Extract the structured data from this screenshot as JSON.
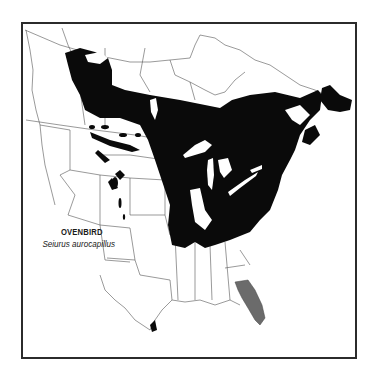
{
  "map": {
    "title_common": "OVENBIRD",
    "title_scientific": "Seiurus aurocapillus",
    "legend": [
      {
        "name": "breeding-range",
        "color": "#0a0a0a"
      },
      {
        "name": "year-round-range",
        "color": "#6b6b6b"
      }
    ],
    "colors": {
      "background": "#ffffff",
      "frame": "#2b2b2b",
      "outline": "#555555",
      "breeding": "#0a0a0a",
      "winter": "#6b6b6b"
    },
    "region": "North America"
  }
}
